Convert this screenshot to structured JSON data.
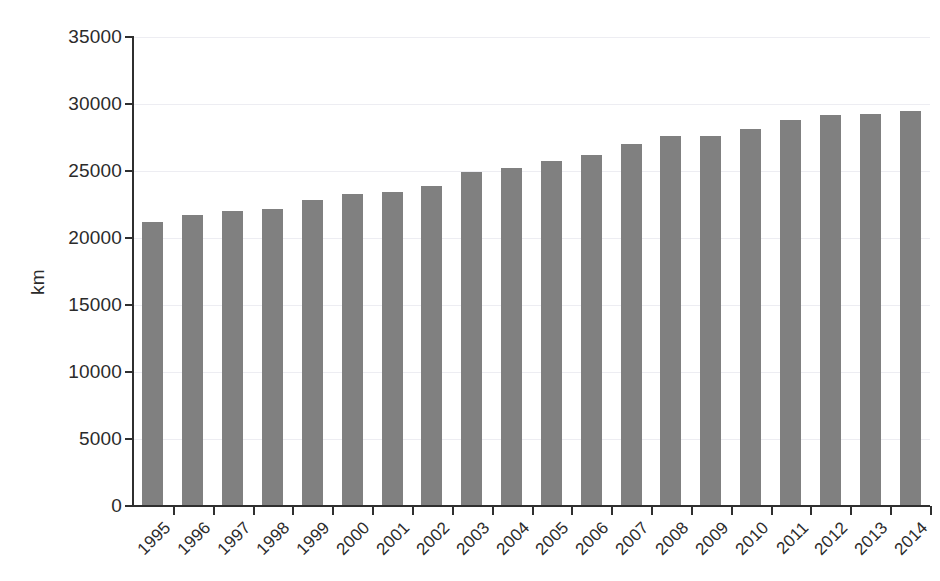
{
  "chart_data": {
    "type": "bar",
    "title": "",
    "subtitle": "",
    "xlabel": "",
    "ylabel": "km",
    "categories": [
      "1995",
      "1996",
      "1997",
      "1998",
      "1999",
      "2000",
      "2001",
      "2002",
      "2003",
      "2004",
      "2005",
      "2006",
      "2007",
      "2008",
      "2009",
      "2010",
      "2011",
      "2012",
      "2013",
      "2014"
    ],
    "values": [
      21200,
      21700,
      22050,
      22200,
      22850,
      23250,
      23450,
      23850,
      24950,
      25200,
      25750,
      26200,
      27000,
      27600,
      27600,
      28100,
      28800,
      29150,
      29250,
      29500
    ],
    "ylim": [
      0,
      35000
    ],
    "ytick_values": [
      0,
      5000,
      10000,
      15000,
      20000,
      25000,
      30000,
      35000
    ],
    "ytick_labels": [
      "0",
      "5000",
      "10000",
      "15000",
      "20000",
      "25000",
      "30000",
      "35000"
    ],
    "grid": true,
    "grid_axis": "y",
    "legend": false,
    "legend_position": "none",
    "bar_color": "#808080",
    "axis_color": "#2f2f2f",
    "gridline_color": "#ededf2",
    "text_color": "#2b2b2b",
    "background_color": "#ffffff",
    "xtick_label_rotation": -45
  }
}
